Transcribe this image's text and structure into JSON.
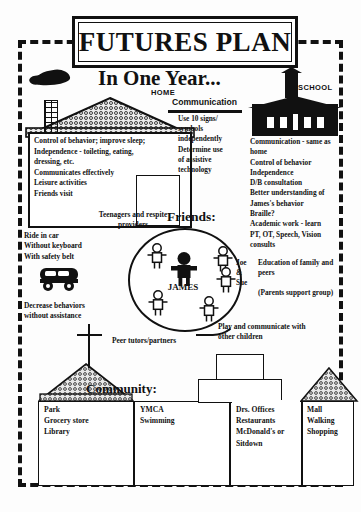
{
  "title": "FUTURES PLAN",
  "subtitle": "In One Year...",
  "labels": {
    "home": "HOME",
    "school": "SCHOOL",
    "friends": "Friends:",
    "community": "Community:",
    "james": "JAMES",
    "communication_heading": "Communication"
  },
  "home": {
    "items": [
      "Control of behavior; improve sleep;",
      "Independence - toileting, eating,",
      "dressing, etc.",
      "Communicates effectively",
      "Leisure activities",
      "Friends visit"
    ]
  },
  "communication": {
    "items": [
      "Use 10 signs/",
      "symbols",
      "independently",
      "Determine use",
      "of assistive",
      "technology"
    ]
  },
  "school": {
    "items": [
      "Communication - same as",
      "home",
      "Control of behavior",
      "Independence",
      "D/B consultation",
      "Better understanding of",
      "James's behavior",
      "Braille?",
      "Academic work - learn",
      "PT, OT, Speech, Vision",
      "consults"
    ]
  },
  "family": {
    "names": "Joe\n&\nSue",
    "education": "Education of family and peers",
    "support": "(Parents support group)"
  },
  "friends_notes": {
    "teenagers": "Teenagers and respite providers",
    "peer_tutors": "Peer tutors/partners",
    "play": "Play and communicate with other children"
  },
  "transport": {
    "items": [
      "Ride in car",
      "Without keyboard",
      "With safety belt"
    ],
    "icon": "bus-icon"
  },
  "behavior": {
    "items": [
      "Decrease behaviors",
      " without assistance"
    ]
  },
  "community": {
    "columns": [
      {
        "name": "park-column",
        "items": [
          "Park",
          "Grocery store",
          "Library"
        ]
      },
      {
        "name": "ymca-column",
        "items": [
          "YMCA",
          "Swimming"
        ]
      },
      {
        "name": "offices-column",
        "items": [
          "Drs. Offices",
          "Restaurants",
          "McDonald's or",
          "Sitdown"
        ]
      },
      {
        "name": "mall-column",
        "items": [
          "Mall",
          "Walking",
          "Shopping"
        ]
      }
    ]
  },
  "colors": {
    "ink": "#111111",
    "paper": "#fdfdfd",
    "texture": "#e9e9e9"
  }
}
